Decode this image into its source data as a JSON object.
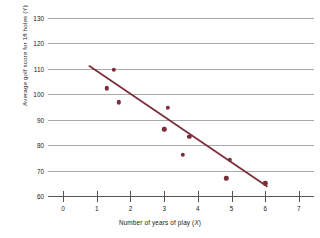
{
  "chart_data": {
    "type": "scatter",
    "title": "",
    "xlabel": "Number of years of play (X)",
    "ylabel": "Average golf score for 18 holes (Y)",
    "xlim": [
      -0.45,
      7.45
    ],
    "ylim": [
      60,
      133
    ],
    "xticks": [
      0,
      1,
      2,
      3,
      4,
      5,
      6,
      7
    ],
    "xtick_labels": [
      "0",
      "1",
      "2",
      "3",
      "4",
      "5",
      "6",
      "7"
    ],
    "yticks": [
      60,
      70,
      80,
      90,
      100,
      110,
      120,
      130
    ],
    "ytick_labels": [
      "60",
      "70",
      "80",
      "90",
      "100",
      "110",
      "120",
      "130"
    ],
    "grid": "horizontal",
    "legend": "none",
    "marker_color": "#7b2d3a",
    "trendline_color": "#7b2d3a",
    "gridline_color": "#a8a8a8",
    "axis_color": "#555555",
    "background_color": "#ffffff",
    "points": [
      {
        "x": 1.3,
        "y": 102.2
      },
      {
        "x": 1.5,
        "y": 109.5
      },
      {
        "x": 1.65,
        "y": 96.8
      },
      {
        "x": 3.0,
        "y": 86.2
      },
      {
        "x": 3.1,
        "y": 94.7
      },
      {
        "x": 3.55,
        "y": 76.2
      },
      {
        "x": 3.75,
        "y": 83.2
      },
      {
        "x": 4.85,
        "y": 67.0
      },
      {
        "x": 4.95,
        "y": 74.2
      },
      {
        "x": 6.0,
        "y": 65.0
      }
    ],
    "trendline": {
      "x_start": 0.78,
      "y_start": 111.0,
      "x_end": 6.05,
      "y_end": 63.8
    }
  }
}
